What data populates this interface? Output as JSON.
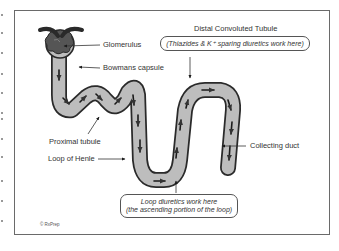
{
  "diagram": {
    "labels": {
      "glomerulus": "Glomerulus",
      "bowmans_capsule": "Bowmans capsule",
      "proximal_tubule": "Proximal tubule",
      "loop_of_henle": "Loop of Henle",
      "collecting_duct": "Collecting duct",
      "distal_convoluted_tubule": "Distal Convoluted Tubule"
    },
    "notes": {
      "distal": "(Thiazides & K⁺ sparing diuretics work here)",
      "loop_line1": "Loop diuretics work here",
      "loop_line2": "(the ascending portion of the loop)"
    },
    "copyright": "© RxPrep",
    "colors": {
      "tubule_fill": "#bdbdbd",
      "tubule_stroke": "#2a2a2a",
      "glomerulus_fill": "#555555",
      "frame": "#6a6a6a",
      "text": "#333333"
    }
  }
}
